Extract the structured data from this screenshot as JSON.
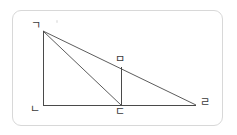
{
  "figure": {
    "type": "geometry-diagram",
    "stroke_color": "#4a4a4a",
    "frame_color": "#d8d8d8",
    "background_color": "#ffffff",
    "label_color": "#3a3a3a",
    "vertices": [
      {
        "id": "g",
        "label": "ㄱ",
        "x": 43,
        "y": 31
      },
      {
        "id": "n",
        "label": "ㄴ",
        "x": 43,
        "y": 105
      },
      {
        "id": "d",
        "label": "ㄷ",
        "x": 121,
        "y": 105
      },
      {
        "id": "r",
        "label": "ㄹ",
        "x": 196,
        "y": 105
      },
      {
        "id": "m",
        "label": "ㅁ",
        "x": 121,
        "y": 67
      }
    ],
    "segments": [
      {
        "id": "g-n",
        "from": "g",
        "to": "n",
        "x1": 43,
        "y1": 31,
        "x2": 43,
        "y2": 105
      },
      {
        "id": "n-r",
        "from": "n",
        "to": "r",
        "x1": 43,
        "y1": 105,
        "x2": 196,
        "y2": 105
      },
      {
        "id": "g-d",
        "from": "g",
        "to": "d",
        "x1": 43,
        "y1": 31,
        "x2": 121,
        "y2": 105
      },
      {
        "id": "g-r",
        "from": "g",
        "to": "r",
        "x1": 43,
        "y1": 31,
        "x2": 196,
        "y2": 105
      },
      {
        "id": "m-d",
        "from": "m",
        "to": "d",
        "x1": 121,
        "y1": 67,
        "x2": 121,
        "y2": 105
      }
    ]
  }
}
